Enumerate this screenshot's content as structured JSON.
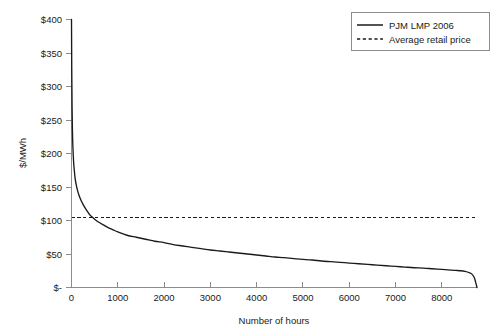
{
  "chart_data": {
    "type": "line",
    "title": "",
    "subtitle": "",
    "xlabel": "Number of hours",
    "ylabel": "$/MWh",
    "xlim": [
      0,
      8760
    ],
    "ylim": [
      0,
      400
    ],
    "grid": false,
    "legend_position": "top-right",
    "x_ticks": [
      0,
      1000,
      2000,
      3000,
      4000,
      5000,
      6000,
      7000,
      8000
    ],
    "x_tick_labels": [
      "0",
      "1000",
      "2000",
      "3000",
      "4000",
      "5000",
      "6000",
      "7000",
      "8000"
    ],
    "y_ticks": [
      0,
      50,
      100,
      150,
      200,
      250,
      300,
      350,
      400
    ],
    "y_tick_labels": [
      "$-",
      "$50",
      "$100",
      "$150",
      "$200",
      "$250",
      "$300",
      "$350",
      "$400"
    ],
    "series": [
      {
        "name": "PJM LMP 2006",
        "style": "solid",
        "color": "#1a1a1a",
        "x": [
          0,
          5,
          12,
          20,
          30,
          45,
          60,
          80,
          100,
          130,
          160,
          200,
          250,
          300,
          350,
          400,
          450,
          500,
          600,
          700,
          800,
          900,
          1000,
          1200,
          1400,
          1600,
          1800,
          2000,
          2200,
          2400,
          2600,
          2800,
          3000,
          3200,
          3400,
          3600,
          3800,
          4000,
          4200,
          4400,
          4600,
          4800,
          5000,
          5200,
          5400,
          5600,
          5800,
          6000,
          6200,
          6400,
          6600,
          6800,
          7000,
          7200,
          7400,
          7600,
          7800,
          8000,
          8200,
          8300,
          8400,
          8500,
          8600,
          8650,
          8700,
          8730,
          8760
        ],
        "y": [
          400,
          330,
          270,
          235,
          210,
          188,
          175,
          162,
          154,
          145,
          138,
          131,
          124,
          118,
          113,
          108,
          105,
          102,
          97,
          93,
          89,
          86,
          83,
          78,
          75,
          72,
          69,
          67,
          64,
          62,
          60,
          58,
          56,
          54.5,
          53,
          51.5,
          50,
          48.5,
          47,
          45.5,
          44.5,
          43,
          42,
          41,
          39.5,
          38.5,
          37.5,
          36.5,
          35.5,
          34.5,
          33.5,
          32.5,
          31.5,
          30.5,
          29.5,
          29,
          28,
          27,
          26,
          25.5,
          25,
          24,
          22,
          20,
          15,
          8,
          0
        ]
      },
      {
        "name": "Average retail price",
        "style": "dashed",
        "color": "#1a1a1a",
        "constant_value": 105,
        "x": [
          0,
          8760
        ],
        "y": [
          105,
          105
        ]
      }
    ],
    "annotations": []
  },
  "legend": {
    "entries": [
      {
        "label": "PJM LMP 2006",
        "style": "solid"
      },
      {
        "label": "Average retail price",
        "style": "dashed"
      }
    ]
  },
  "axes": {
    "x_title": "Number of hours",
    "y_title": "$/MWh"
  },
  "colors": {
    "series": "#1a1a1a",
    "axis": "#8c8c8c",
    "background": "#ffffff",
    "text": "#1a1a1a"
  }
}
